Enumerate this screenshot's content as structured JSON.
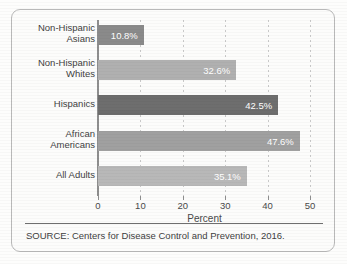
{
  "chart_data": {
    "type": "bar",
    "orientation": "horizontal",
    "title": "",
    "xlabel": "Percent",
    "ylabel": "",
    "xlim": [
      0,
      50
    ],
    "xticks": [
      "0",
      "10",
      "20",
      "30",
      "40",
      "50"
    ],
    "grid": "vertical-dashed",
    "legend": "none",
    "categories": [
      "Non-Hispanic\nAsians",
      "Non-Hispanic\nWhites",
      "Hispanics",
      "African\nAmericans",
      "All Adults"
    ],
    "values": [
      10.8,
      32.6,
      42.5,
      47.6,
      35.1
    ],
    "value_labels": [
      "10.8%",
      "32.6%",
      "42.5%",
      "47.6%",
      "35.1%"
    ],
    "bar_colors": [
      "#8a8a8a",
      "#b0b0b0",
      "#6e6e6e",
      "#a0a0a0",
      "#b8b8b8"
    ],
    "value_label_color": "#ffffff"
  },
  "footer": {
    "source": "SOURCE: Centers for Disease Control and Prevention, 2016."
  },
  "style": {
    "frame_border": "#b9b9b9",
    "axis_color": "#8e8e8e",
    "grid_color": "#c9c9c9",
    "text_color": "#3f3f3f",
    "background": "#fcfcfb"
  }
}
